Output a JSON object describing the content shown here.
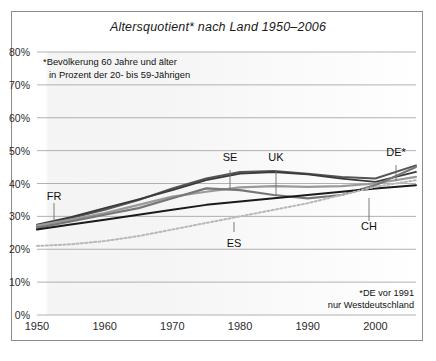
{
  "chart_data": {
    "type": "line",
    "title": "Altersquotient* nach Land 1950–2006",
    "note": "*Bevölkerung 60 Jahre und älter",
    "note_line2": "in Prozent der 20- bis 59-Jährigen",
    "footnote_line1": "*DE vor 1991",
    "footnote_line2": "nur Westdeutschland",
    "xlabel": "",
    "ylabel": "",
    "xlim": [
      1950,
      2006
    ],
    "ylim": [
      0,
      80
    ],
    "grid": true,
    "legend_position": "inline-labels",
    "yticks": [
      "0%",
      "10%",
      "20%",
      "30%",
      "40%",
      "50%",
      "60%",
      "70%",
      "80%"
    ],
    "ytick_values": [
      0,
      10,
      20,
      30,
      40,
      50,
      60,
      70,
      80
    ],
    "xticks": [
      "1950",
      "1960",
      "1970",
      "1980",
      "1990",
      "2000"
    ],
    "xtick_values": [
      1950,
      1960,
      1970,
      1980,
      1990,
      2000
    ],
    "x": [
      1950,
      1955,
      1960,
      1965,
      1970,
      1975,
      1980,
      1985,
      1990,
      1995,
      2000,
      2006
    ],
    "series": [
      {
        "name": "SE",
        "label": "SE",
        "color": "#555555",
        "style": "solid",
        "width": 2.0,
        "values": [
          27.0,
          29.5,
          32.0,
          35.0,
          38.5,
          41.5,
          43.5,
          43.8,
          43.0,
          42.0,
          41.5,
          45.5
        ]
      },
      {
        "name": "UK",
        "label": "UK",
        "color": "#3a3a3a",
        "style": "solid",
        "width": 1.8,
        "values": [
          27.5,
          29.8,
          32.5,
          35.2,
          38.0,
          41.0,
          43.0,
          43.5,
          42.8,
          41.5,
          40.5,
          43.5
        ]
      },
      {
        "name": "FR",
        "label": "FR",
        "color": "#9a9a9a",
        "style": "solid",
        "width": 2.2,
        "values": [
          27.2,
          29.0,
          31.0,
          33.5,
          36.0,
          37.5,
          38.8,
          39.2,
          39.0,
          39.2,
          40.0,
          42.0
        ]
      },
      {
        "name": "DE*",
        "label": "DE*",
        "color": "#777777",
        "style": "solid",
        "width": 2.2,
        "values": [
          26.5,
          28.5,
          30.5,
          32.5,
          35.5,
          38.5,
          38.0,
          36.5,
          35.5,
          36.5,
          39.5,
          45.0
        ]
      },
      {
        "name": "CH",
        "label": "CH",
        "color": "#1a1a1a",
        "style": "solid",
        "width": 2.0,
        "values": [
          26.0,
          27.5,
          29.0,
          30.5,
          32.0,
          33.5,
          34.5,
          35.5,
          36.5,
          37.5,
          38.5,
          39.5
        ]
      },
      {
        "name": "ES",
        "label": "ES",
        "color": "#b8b8b8",
        "style": "dotted",
        "width": 2.0,
        "values": [
          21.0,
          21.5,
          22.5,
          24.0,
          26.0,
          28.0,
          30.0,
          32.0,
          34.0,
          36.5,
          39.0,
          41.0
        ]
      }
    ],
    "annotations": [
      {
        "text": "SE",
        "x": 230,
        "y": 158,
        "leader_from_y": 170,
        "leader_to_y": 190
      },
      {
        "text": "UK",
        "x": 276,
        "y": 158,
        "leader_from_y": 170,
        "leader_to_y": 196
      },
      {
        "text": "DE*",
        "x": 396,
        "y": 153,
        "leader_from_y": 165,
        "leader_to_y": 181
      },
      {
        "text": "FR",
        "x": 54,
        "y": 197,
        "leader_from_y": 203,
        "leader_to_y": 221
      },
      {
        "text": "ES",
        "x": 234,
        "y": 244,
        "leader_from_y": 232,
        "leader_to_y": 222
      },
      {
        "text": "CH",
        "x": 369,
        "y": 227,
        "leader_from_y": 221,
        "leader_to_y": 198
      }
    ]
  }
}
